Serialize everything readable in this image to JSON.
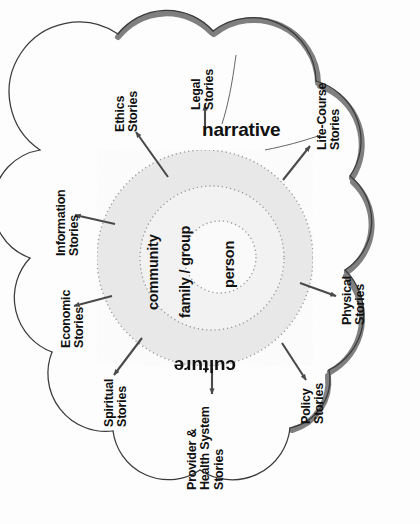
{
  "diagram": {
    "type": "concentric-circles-with-radiating-story-clouds",
    "colors": {
      "background": "#fdfdfd",
      "cloud_outline": "#3b3b3b",
      "cloud_shadow": "#7f7f7f",
      "cloud_fill": "#fefefe",
      "ring_outer_fill": "#e9e9e9",
      "ring_middle_fill": "#f2f2f2",
      "ring_inner_fill": "#fbfbfb",
      "ring_border": "#9a9a9a",
      "text": "#111111",
      "arrow": "#4a4a4a"
    }
  },
  "axis_labels": {
    "narrative": "narrative",
    "culture": "culture"
  },
  "core_rings": [
    {
      "id": "community",
      "label": "community",
      "level": 3
    },
    {
      "id": "family-group",
      "label": "family / group",
      "level": 2
    },
    {
      "id": "person",
      "label": "person",
      "level": 1
    }
  ],
  "story_domains": [
    {
      "id": "legal",
      "label": "Legal\nStories"
    },
    {
      "id": "life-course",
      "label": "Life-Course\nStories"
    },
    {
      "id": "physical",
      "label": "Physical\nStories"
    },
    {
      "id": "policy",
      "label": "Policy\nStories"
    },
    {
      "id": "provider-health",
      "label": "Provider &\nHealth System\nStories"
    },
    {
      "id": "spiritual",
      "label": "Spiritual\nStories"
    },
    {
      "id": "economic",
      "label": "Economic\nStories"
    },
    {
      "id": "information",
      "label": "Information\nStories"
    },
    {
      "id": "ethics",
      "label": "Ethics\nStories"
    }
  ]
}
